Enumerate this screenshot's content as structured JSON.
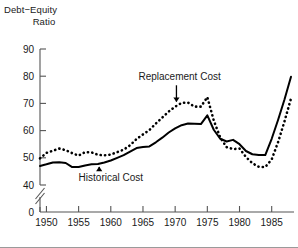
{
  "chart_data": {
    "type": "line",
    "title": "",
    "ylabel": "Debt-Equity Ratio",
    "ylabel_line1": "Debt−Equity",
    "ylabel_line2": "Ratio",
    "xlabel": "",
    "xlim": [
      1949,
      1988
    ],
    "ylim": [
      40,
      90
    ],
    "y_axis_break": true,
    "y_break_between": [
      0,
      40
    ],
    "grid": false,
    "legend_position": "inline-annotations",
    "yticks": [
      0,
      40,
      50,
      60,
      70,
      80,
      90
    ],
    "ytick_labels": [
      "0",
      "40",
      "50",
      "60",
      "70",
      "80",
      "90"
    ],
    "xticks": [
      1950,
      1955,
      1960,
      1965,
      1970,
      1975,
      1980,
      1985
    ],
    "xtick_labels": [
      "1950",
      "1955",
      "1960",
      "1965",
      "1970",
      "1975",
      "1980",
      "1985"
    ],
    "x": [
      1949,
      1950,
      1951,
      1952,
      1953,
      1954,
      1955,
      1956,
      1957,
      1958,
      1959,
      1960,
      1961,
      1962,
      1963,
      1964,
      1965,
      1966,
      1967,
      1968,
      1969,
      1970,
      1971,
      1972,
      1973,
      1974,
      1975,
      1976,
      1977,
      1978,
      1979,
      1980,
      1981,
      1982,
      1983,
      1984,
      1985,
      1986,
      1987,
      1988
    ],
    "series": [
      {
        "name": "Historical Cost",
        "style": "solid",
        "color": "#000000",
        "values": [
          47.0,
          47.6,
          48.3,
          48.4,
          48.1,
          46.6,
          46.6,
          47.2,
          47.6,
          47.7,
          48.3,
          49.0,
          50.0,
          51.0,
          52.3,
          53.6,
          54.0,
          54.2,
          55.7,
          57.4,
          59.3,
          60.8,
          62.0,
          62.6,
          62.5,
          62.4,
          65.6,
          60.3,
          57.0,
          56.0,
          56.6,
          55.0,
          52.5,
          51.3,
          51.0,
          51.0,
          57.0,
          64.0,
          71.5,
          79.8
        ]
      },
      {
        "name": "Replacement Cost",
        "style": "dotted",
        "color": "#000000",
        "values": [
          49.8,
          51.8,
          52.6,
          53.4,
          52.8,
          51.7,
          50.8,
          52.1,
          52.0,
          51.1,
          50.9,
          51.2,
          52.1,
          53.0,
          54.6,
          56.9,
          58.6,
          60.2,
          62.6,
          64.8,
          67.0,
          68.8,
          70.2,
          70.3,
          68.8,
          68.8,
          72.3,
          63.7,
          57.5,
          53.9,
          53.2,
          53.4,
          50.3,
          48.0,
          46.7,
          46.6,
          49.4,
          55.8,
          63.5,
          71.8
        ]
      }
    ],
    "annotations": [
      {
        "text": "Replacement Cost",
        "series": "Replacement Cost",
        "arrow": "down",
        "point_x": 1970.2,
        "point_y": 69.0,
        "label_x": 1964.3,
        "label_y": 78.5
      },
      {
        "text": "Historical Cost",
        "series": "Historical Cost",
        "arrow": "up",
        "point_x": 1958.2,
        "point_y": 48.6,
        "label_x": 1955.0,
        "label_y": 41.6
      }
    ]
  }
}
